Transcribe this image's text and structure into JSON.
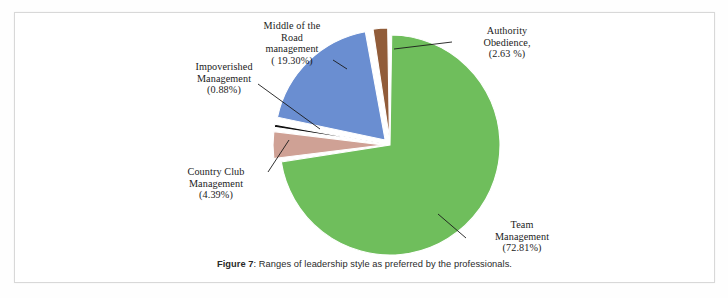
{
  "figure": {
    "caption_label": "Figure 7",
    "caption_separator": ": ",
    "caption_text": "Ranges of leadership style as preferred by the professionals."
  },
  "chart_data": {
    "type": "pie",
    "title": "Ranges of leadership style as preferred by the professionals.",
    "xlabel": "",
    "ylabel": "",
    "legend_position": "none",
    "grid": false,
    "labels_outside": true,
    "start_angle_deg": 0,
    "direction": "clockwise",
    "categories": [
      "Team Management",
      "Country Club Management",
      "Impoverished Management",
      "Middle of the Road management",
      "Authority Obedience"
    ],
    "values": [
      72.81,
      4.39,
      0.88,
      19.3,
      2.63
    ],
    "units": "percent",
    "colors": [
      "#6fbe5c",
      "#cfa195",
      "#111111",
      "#6a8ed1",
      "#915c39"
    ],
    "slices": [
      {
        "name": "Team Management",
        "value": 72.81,
        "color": "#6fbe5c",
        "label_lines": "Team\nManagement\n(72.81%)"
      },
      {
        "name": "Country Club Management",
        "value": 4.39,
        "color": "#cfa195",
        "label_lines": "Country Club\nManagement\n(4.39%)"
      },
      {
        "name": "Impoverished Management",
        "value": 0.88,
        "color": "#111111",
        "label_lines": "Impoverished\nManagement\n(0.88%)"
      },
      {
        "name": "Middle of the Road management",
        "value": 19.3,
        "color": "#6a8ed1",
        "label_lines": "Middle of the\nRoad\nmanagement\n( 19.30%)"
      },
      {
        "name": "Authority Obedience",
        "value": 2.63,
        "color": "#915c39",
        "label_lines": "Authority\nObedience,\n(2.63 %)"
      }
    ]
  }
}
